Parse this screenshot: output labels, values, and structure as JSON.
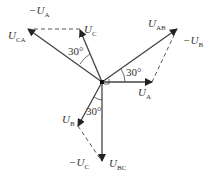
{
  "labels": {
    "U_A": {
      "main": "U",
      "sub": "A",
      "prefix": ""
    },
    "neg_U_A": {
      "main": "U",
      "sub": "A",
      "prefix": "−"
    },
    "U_C": {
      "main": "U",
      "sub": "C",
      "prefix": ""
    },
    "U_CA": {
      "main": "U",
      "sub": "CA",
      "prefix": ""
    },
    "U_AB": {
      "main": "U",
      "sub": "AB",
      "prefix": ""
    },
    "neg_U_B": {
      "main": "U",
      "sub": "B",
      "prefix": "−"
    },
    "U_B": {
      "main": "U",
      "sub": "B",
      "prefix": ""
    },
    "neg_U_C": {
      "main": "U",
      "sub": "C",
      "prefix": "−"
    },
    "U_BC": {
      "main": "U",
      "sub": "BC",
      "prefix": ""
    }
  },
  "angles": {
    "a1": "30°",
    "a2": "30°",
    "a3": "30°"
  },
  "colors": {
    "line": "#444444",
    "dashed": "#555555"
  }
}
